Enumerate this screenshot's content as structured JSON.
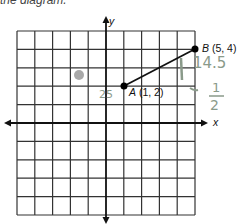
{
  "caption": "the diagram.",
  "graph": {
    "x_axis_label": "x",
    "y_axis_label": "y",
    "grid": {
      "columns": 10,
      "rows": 10,
      "x_range": [
        -5,
        5
      ],
      "y_range": [
        -5,
        5
      ]
    },
    "points": [
      {
        "name": "A",
        "coords": "(1, 2)",
        "x": 1,
        "y": 2
      },
      {
        "name": "B",
        "coords": "(5, 4)",
        "x": 5,
        "y": 4
      }
    ],
    "segment": "AB"
  },
  "handwriting": {
    "near_a": "25",
    "right_top": "14.5",
    "right_mid": "1",
    "fraction_num": "1",
    "fraction_den": "2"
  },
  "colors": {
    "grid": "#222222",
    "point": "#000000",
    "pencil": "#8a9a8a",
    "smudge": "#9a9a9a"
  }
}
